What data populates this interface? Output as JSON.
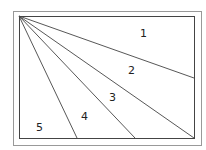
{
  "diagram": {
    "colors": {
      "stroke": "#444444",
      "outer_frame": "#999999",
      "label": "#222222",
      "background": "#ffffff"
    },
    "outer_frame": {
      "x": 13,
      "y": 11,
      "width": 188,
      "height": 134
    },
    "rectangle": {
      "x": 19,
      "y": 16,
      "width": 175,
      "height": 122
    },
    "apex": {
      "x": 19,
      "y": 16
    },
    "lines": [
      {
        "id": "line-1",
        "x2": 194,
        "y2": 78
      },
      {
        "id": "line-2",
        "x2": 194,
        "y2": 138
      },
      {
        "id": "line-3",
        "x2": 135,
        "y2": 138
      },
      {
        "id": "line-4",
        "x2": 77,
        "y2": 138
      }
    ],
    "regions": [
      {
        "label": "1",
        "x": 140,
        "y": 37
      },
      {
        "label": "2",
        "x": 128,
        "y": 74
      },
      {
        "label": "3",
        "x": 109,
        "y": 101
      },
      {
        "label": "4",
        "x": 81,
        "y": 120
      },
      {
        "label": "5",
        "x": 36,
        "y": 131
      }
    ]
  }
}
